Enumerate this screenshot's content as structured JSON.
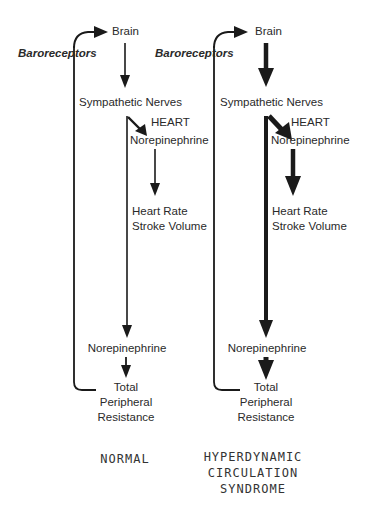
{
  "panels": [
    {
      "id": "normal",
      "caption": "NORMAL",
      "arrow_weight": "thin",
      "nodes": {
        "brain": "Brain",
        "baroreceptors": "Baroreceptors",
        "sympathetic_nerves": "Sympathetic Nerves",
        "heart": "HEART",
        "norepinephrine_heart": "Norepinephrine",
        "heart_rate": "Heart Rate",
        "stroke_volume": "Stroke Volume",
        "norepinephrine_vessels": "Norepinephrine",
        "tpr_line1": "Total",
        "tpr_line2": "Peripheral",
        "tpr_line3": "Resistance"
      }
    },
    {
      "id": "hyperdynamic",
      "caption_lines": [
        "HYPERDYNAMIC",
        "CIRCULATION",
        "SYNDROME"
      ],
      "arrow_weight": "thick",
      "nodes": {
        "brain": "Brain",
        "baroreceptors": "Baroreceptors",
        "sympathetic_nerves": "Sympathetic Nerves",
        "heart": "HEART",
        "norepinephrine_heart": "Norepinephrine",
        "heart_rate": "Heart Rate",
        "stroke_volume": "Stroke Volume",
        "norepinephrine_vessels": "Norepinephrine",
        "tpr_line1": "Total",
        "tpr_line2": "Peripheral",
        "tpr_line3": "Resistance"
      }
    }
  ],
  "edges": [
    {
      "from": "baroreceptors",
      "to": "brain"
    },
    {
      "from": "brain",
      "to": "sympathetic_nerves"
    },
    {
      "from": "sympathetic_nerves",
      "to": "norepinephrine_heart"
    },
    {
      "from": "norepinephrine_heart",
      "to": "heart_rate_stroke_volume"
    },
    {
      "from": "sympathetic_nerves",
      "to": "norepinephrine_vessels"
    },
    {
      "from": "norepinephrine_vessels",
      "to": "total_peripheral_resistance"
    },
    {
      "from": "total_peripheral_resistance",
      "to": "baroreceptors",
      "type": "feedback-loop"
    }
  ],
  "colors": {
    "ink": "#1a1a1a",
    "text": "#2a2a2a",
    "background": "#ffffff"
  }
}
